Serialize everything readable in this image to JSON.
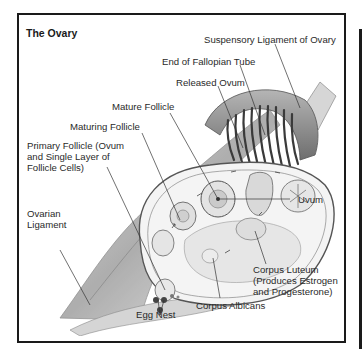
{
  "diagram": {
    "title": "The Ovary",
    "labels": {
      "suspensory_ligament": "Suspensory Ligament of Ovary",
      "end_fallopian_tube": "End of Fallopian Tube",
      "released_ovum": "Released Ovum",
      "mature_follicle": "Mature Follicle",
      "maturing_follicle": "Maturing Follicle",
      "primary_follicle": [
        "Primary Follicle (Ovum",
        "and Single Layer of",
        "Follicle Cells)"
      ],
      "uvum": "Uvum",
      "ovarian_ligament": [
        "Ovarian",
        "Ligament"
      ],
      "corpus_luteum": [
        "Corpus Luteum",
        "(Produces Estrogen",
        "and Progesterone)"
      ],
      "corpus_albicans": "Corpus Albicans",
      "egg_nest": "Egg Nest"
    },
    "colors": {
      "frame": "#1a1a1a",
      "text": "#2a2a2a",
      "tissue_dark": "#8a8a8a",
      "tissue_light": "#d8d8d8"
    }
  }
}
